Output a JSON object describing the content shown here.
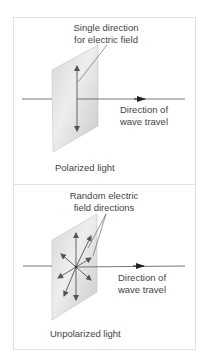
{
  "panels": [
    {
      "id": "polarized",
      "annotation_line1": "Single direction",
      "annotation_line2": "for electric field",
      "direction_line1": "Direction of",
      "direction_line2": "wave travel",
      "caption": "Polarized light"
    },
    {
      "id": "unpolarized",
      "annotation_line1": "Random electric",
      "annotation_line2": "field directions",
      "direction_line1": "Direction of",
      "direction_line2": "wave travel",
      "caption": "Unpolarized light"
    }
  ],
  "colors": {
    "frame": "#e2e2e2",
    "plate_light": "#e8e8e8",
    "plate_dark": "#c4c4c4",
    "line": "#555555",
    "text": "#444444"
  }
}
